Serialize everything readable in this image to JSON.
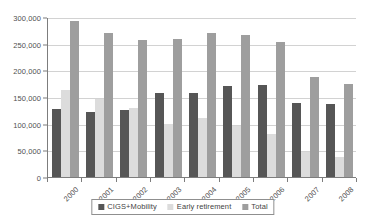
{
  "chart_data": {
    "type": "bar",
    "title": "",
    "subtitle": "",
    "xlabel": "",
    "ylabel": "",
    "categories": [
      "2000",
      "2001",
      "2002",
      "2003",
      "2004",
      "2005",
      "2006",
      "2007",
      "2008"
    ],
    "series": [
      {
        "name": "CIGS+Mobility",
        "color": "#565656",
        "values": [
          127000,
          121000,
          126000,
          157000,
          157000,
          171000,
          172000,
          138000,
          136000
        ]
      },
      {
        "name": "Early retirement",
        "color": "#dcdcdc",
        "values": [
          164000,
          146000,
          129000,
          99000,
          110000,
          95000,
          80000,
          46000,
          37000
        ]
      },
      {
        "name": "Total",
        "color": "#9e9e9e",
        "values": [
          293000,
          270000,
          256000,
          259000,
          270000,
          266000,
          253000,
          188000,
          175000
        ]
      }
    ],
    "ylim": [
      0,
      300000
    ],
    "ytick_values": [
      0,
      50000,
      100000,
      150000,
      200000,
      250000,
      300000
    ],
    "ytick_labels": [
      "0",
      "50,000",
      "100,000",
      "150,000",
      "200,000",
      "250,000",
      "300,000"
    ],
    "grid": true,
    "grid_axis": "y",
    "legend_position": "bottom-center",
    "xtick_rotation": -45
  }
}
